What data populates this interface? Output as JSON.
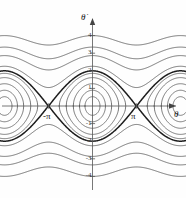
{
  "figure": {
    "caption": "",
    "y_axis_label": "θ̇",
    "x_axis_label": "θ",
    "x_pi_left_label": "-π",
    "x_pi_right_label": "π",
    "stroke_color": "#4a4a4a",
    "separatrix_color": "#1c1c1c",
    "axis_color": "#555555",
    "background": "#fefefe"
  },
  "chart_data": {
    "type": "line",
    "title": "",
    "subtitle": "",
    "xlabel": "θ",
    "ylabel": "θ̇",
    "grid": false,
    "legend": "none",
    "xlim": [
      -9.4248,
      9.4248
    ],
    "ylim": [
      -4.8,
      4.8
    ],
    "xticks": [
      -3.1416,
      3.1416
    ],
    "xtick_labels": [
      "-π",
      "π"
    ],
    "yticks": [
      4,
      3,
      2,
      1,
      -1,
      -2,
      -3,
      -4
    ],
    "ytick_labels": [
      "4",
      "3",
      "2",
      "1",
      "-1",
      "-2",
      "-3",
      "-4"
    ],
    "equation": "0.5*thetadot^2 - cos(theta) = E",
    "fixed_points": {
      "centers_theta": [
        -6.2832,
        0,
        6.2832
      ],
      "centers_thetadot": [
        0,
        0,
        0
      ],
      "saddles_theta": [
        -9.4248,
        -3.1416,
        3.1416,
        9.4248
      ],
      "saddles_thetadot": [
        0,
        0,
        0,
        0
      ]
    },
    "series": [
      {
        "name": "closed-orbit-inner-1",
        "kind": "libration",
        "E": -0.86,
        "amplitude_thetadot": 0.53,
        "amplitude_theta": 0.53
      },
      {
        "name": "closed-orbit-inner-2",
        "kind": "libration",
        "E": -0.6,
        "amplitude_thetadot": 0.89,
        "amplitude_theta": 0.93
      },
      {
        "name": "closed-orbit-inner-3",
        "kind": "libration",
        "E": -0.2,
        "amplitude_thetadot": 1.26,
        "amplitude_theta": 1.37
      },
      {
        "name": "closed-orbit-inner-4",
        "kind": "libration",
        "E": 0.3,
        "amplitude_thetadot": 1.61,
        "amplitude_theta": 1.88
      },
      {
        "name": "closed-orbit-inner-5",
        "kind": "libration",
        "E": 0.72,
        "amplitude_thetadot": 1.86,
        "amplitude_theta": 2.46
      },
      {
        "name": "separatrix-upper",
        "kind": "separatrix",
        "E": 1.0,
        "peak_thetadot": 2.0,
        "bold": true
      },
      {
        "name": "separatrix-lower",
        "kind": "separatrix",
        "E": 1.0,
        "peak_thetadot": -2.0,
        "bold": true
      },
      {
        "name": "running-upper-1",
        "kind": "rotation",
        "E": 1.55,
        "min_thetadot": 0.74,
        "max_thetadot": 2.26
      },
      {
        "name": "running-upper-2",
        "kind": "rotation",
        "E": 3.1,
        "min_thetadot": 2.05,
        "max_thetadot": 2.86
      },
      {
        "name": "running-upper-3",
        "kind": "rotation",
        "E": 4.6,
        "min_thetadot": 2.68,
        "max_thetadot": 3.35
      },
      {
        "name": "running-upper-4",
        "kind": "rotation",
        "E": 7.0,
        "min_thetadot": 3.46,
        "max_thetadot": 4.0
      },
      {
        "name": "running-lower-1",
        "kind": "rotation",
        "E": 1.55,
        "min_thetadot": -2.26,
        "max_thetadot": -0.74
      },
      {
        "name": "running-lower-2",
        "kind": "rotation",
        "E": 3.1,
        "min_thetadot": -2.86,
        "max_thetadot": -2.05
      },
      {
        "name": "running-lower-3",
        "kind": "rotation",
        "E": 4.6,
        "min_thetadot": -3.35,
        "max_thetadot": -2.68
      },
      {
        "name": "running-lower-4",
        "kind": "rotation",
        "E": 7.0,
        "min_thetadot": -4.0,
        "max_thetadot": -3.46
      }
    ]
  }
}
